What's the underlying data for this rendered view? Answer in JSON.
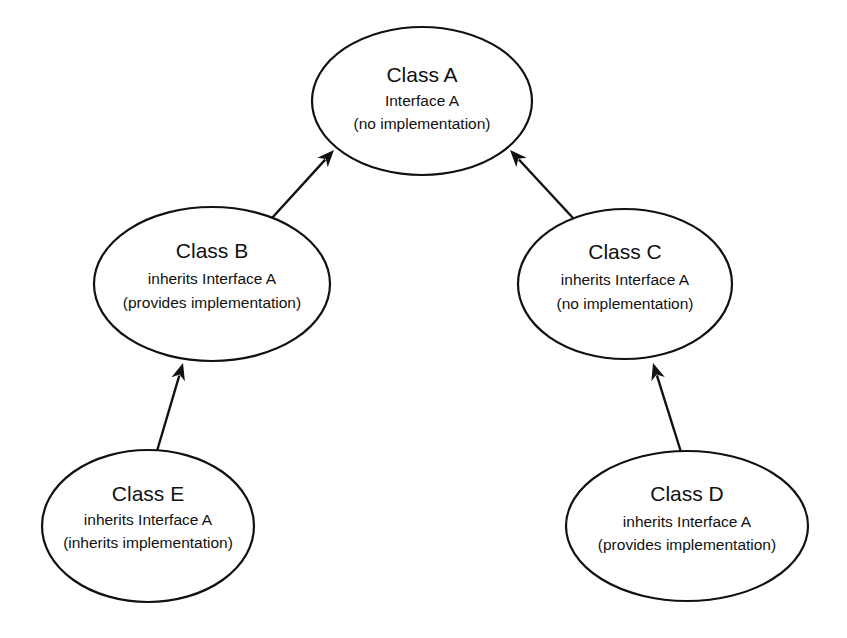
{
  "diagram": {
    "type": "class-inheritance-diagram",
    "nodes": {
      "A": {
        "id": "A",
        "title": "Class A",
        "line1": "Interface A",
        "line2": "(no implementation)",
        "cx": 422,
        "cy": 101,
        "rx": 110,
        "ry": 74,
        "title_y": 82,
        "line1_y": 106,
        "line2_y": 129
      },
      "B": {
        "id": "B",
        "title": "Class B",
        "line1": "inherits Interface A",
        "line2": "(provides implementation)",
        "cx": 212,
        "cy": 284,
        "rx": 118,
        "ry": 77,
        "title_y": 258,
        "line1_y": 284,
        "line2_y": 308
      },
      "C": {
        "id": "C",
        "title": "Class C",
        "line1": "inherits Interface A",
        "line2": "(no implementation)",
        "cx": 625,
        "cy": 284,
        "rx": 107,
        "ry": 75,
        "title_y": 259,
        "line1_y": 285,
        "line2_y": 309
      },
      "E": {
        "id": "E",
        "title": "Class E",
        "line1": "inherits Interface A",
        "line2": "(inherits implementation)",
        "cx": 148,
        "cy": 526,
        "rx": 106,
        "ry": 76,
        "title_y": 501,
        "line1_y": 525,
        "line2_y": 548
      },
      "D": {
        "id": "D",
        "title": "Class D",
        "line1": "inherits Interface A",
        "line2": "(provides implementation)",
        "cx": 687,
        "cy": 526,
        "rx": 121,
        "ry": 75,
        "title_y": 501,
        "line1_y": 527,
        "line2_y": 550
      }
    },
    "edges": [
      {
        "from": "B",
        "to": "A",
        "label": "inherits",
        "x1": 272,
        "y1": 218,
        "x2": 334,
        "y2": 150
      },
      {
        "from": "C",
        "to": "A",
        "label": "inherits",
        "x1": 573,
        "y1": 218,
        "x2": 510,
        "y2": 150
      },
      {
        "from": "E",
        "to": "B",
        "label": "inherits",
        "x1": 157,
        "y1": 451,
        "x2": 183,
        "y2": 363
      },
      {
        "from": "D",
        "to": "C",
        "label": "inherits",
        "x1": 681,
        "y1": 452,
        "x2": 653,
        "y2": 363
      }
    ],
    "colors": {
      "stroke": "#111111",
      "fill": "#ffffff",
      "text": "#111111",
      "background": "#ffffff"
    }
  }
}
